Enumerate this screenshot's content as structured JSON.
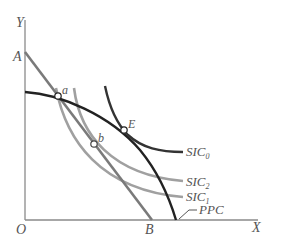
{
  "diagram": {
    "axes": {
      "y_label": "Y",
      "x_label": "X",
      "origin_label": "O"
    },
    "intercepts": {
      "a_label": "A",
      "b_label": "B"
    },
    "points": [
      {
        "label": "a"
      },
      {
        "label": "b"
      },
      {
        "label": "E"
      }
    ],
    "curves": [
      {
        "name": "SIC",
        "sub": "0"
      },
      {
        "name": "SIC",
        "sub": "2"
      },
      {
        "name": "SIC",
        "sub": "1"
      },
      {
        "name": "PPC",
        "sub": ""
      }
    ],
    "colors": {
      "ppc": "#222222",
      "sic0": "#333333",
      "sic_light": "#9a9a9a",
      "line_ab": "#777777",
      "axis": "#888888"
    }
  }
}
